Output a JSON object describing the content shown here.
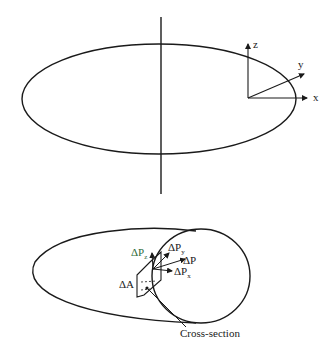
{
  "figure": {
    "top": {
      "shape": "ellipse-with-vertical-axis",
      "axes": {
        "x_label": "x",
        "y_label": "y",
        "z_label": "z"
      }
    },
    "bottom": {
      "shape": "cut-ellipsoid-with-circular-cross-section",
      "labels": {
        "area": "ΔA",
        "force_total": "ΔP",
        "force_x_base": "ΔP",
        "force_x_sub": "x",
        "force_y_base": "ΔP",
        "force_y_sub": "y",
        "force_z_base": "ΔP",
        "force_z_sub": "z",
        "cross_section": "Cross-section"
      }
    },
    "colors": {
      "line": "#1a1a1a",
      "force_z_label": "#2e6b3a"
    }
  }
}
